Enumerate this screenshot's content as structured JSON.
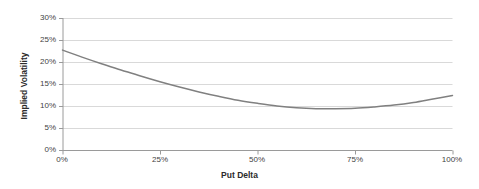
{
  "chart_data": {
    "type": "line",
    "title": "",
    "xlabel": "Put Delta",
    "ylabel": "Implied Volatility",
    "xlim": [
      0,
      100
    ],
    "ylim": [
      0,
      30
    ],
    "xticks": [
      "0%",
      "25%",
      "50%",
      "75%",
      "100%"
    ],
    "xtick_values": [
      0,
      25,
      50,
      75,
      100
    ],
    "yticks": [
      "0%",
      "5%",
      "10%",
      "15%",
      "20%",
      "25%",
      "30%"
    ],
    "ytick_values": [
      0,
      5,
      10,
      15,
      20,
      25,
      30
    ],
    "grid": "horizontal",
    "legend": "none",
    "series": [
      {
        "name": "Implied Volatility",
        "color": "#808080",
        "x": [
          0,
          5,
          10,
          15,
          20,
          25,
          30,
          35,
          40,
          45,
          50,
          55,
          60,
          65,
          70,
          75,
          80,
          85,
          90,
          95,
          100
        ],
        "values": [
          22.7,
          21.1,
          19.6,
          18.2,
          16.8,
          15.5,
          14.3,
          13.2,
          12.2,
          11.3,
          10.6,
          10.0,
          9.6,
          9.4,
          9.4,
          9.5,
          9.8,
          10.2,
          10.8,
          11.6,
          12.4
        ]
      }
    ],
    "axis_color": "#9a9a9a",
    "grid_color": "#d9d9d9",
    "plot_background": "#ffffff"
  },
  "axis_titles": {
    "x": "Put Delta",
    "y": "Implied Volatility"
  }
}
